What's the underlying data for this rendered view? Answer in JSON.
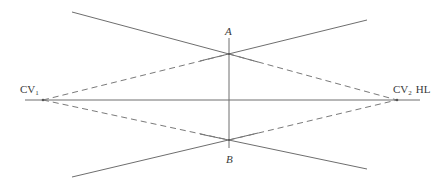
{
  "diagram": {
    "type": "two-point perspective construction (vanishing points and measuring points)",
    "labels": {
      "point_a": "A",
      "point_b": "B",
      "cv1_main": "CV",
      "cv1_sub": "1",
      "cv2_main": "CV",
      "cv2_sub": "2",
      "horizon": "HL"
    },
    "colors": {
      "line": "#6e6e6e",
      "dashed": "#7a7a7a",
      "text": "#3a3a3a",
      "background": "#ffffff"
    },
    "elements": [
      {
        "id": "horizon-line",
        "style": "solid",
        "from": [
          25,
          100
        ],
        "to": [
          420,
          100
        ]
      },
      {
        "id": "vertical-ab",
        "style": "solid",
        "from": [
          229,
          38
        ],
        "to": [
          229,
          148
        ]
      },
      {
        "id": "top-left-line",
        "style": "solid",
        "from": [
          72,
          12
        ],
        "to": [
          229,
          54
        ]
      },
      {
        "id": "top-right-line",
        "style": "solid",
        "from": [
          229,
          54
        ],
        "to": [
          367,
          20
        ]
      },
      {
        "id": "bottom-left-line",
        "style": "solid",
        "from": [
          72,
          177
        ],
        "to": [
          229,
          140
        ]
      },
      {
        "id": "bottom-right-line",
        "style": "solid",
        "from": [
          229,
          140
        ],
        "to": [
          367,
          169
        ]
      },
      {
        "id": "dash-cv1-a",
        "style": "dashed",
        "from": [
          43,
          100
        ],
        "to": [
          229,
          54
        ]
      },
      {
        "id": "dash-cv1-b",
        "style": "dashed",
        "from": [
          43,
          100
        ],
        "to": [
          229,
          140
        ]
      },
      {
        "id": "dash-a-cv2",
        "style": "dashed",
        "from": [
          229,
          54
        ],
        "to": [
          397,
          100
        ]
      },
      {
        "id": "dash-b-cv2",
        "style": "dashed",
        "from": [
          229,
          140
        ],
        "to": [
          397,
          100
        ]
      }
    ]
  }
}
